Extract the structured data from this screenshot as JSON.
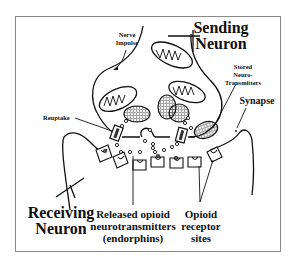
{
  "diagram": {
    "labels": {
      "sending_neuron_line1": "Sending",
      "sending_neuron_line2": "Neuron",
      "nerve_impulse_line1": "Nerve",
      "nerve_impulse_line2": "Impulse",
      "stored_line1": "Stored",
      "stored_line2": "Neuro-",
      "stored_line3": "Transmitters",
      "synapse": "Synapse",
      "reuptake": "Reuptake",
      "receiving_neuron_line1": "Receiving",
      "receiving_neuron_line2": "Neuron",
      "released_line1": "Released opioid",
      "released_line2": "neurotransmitters",
      "released_line3": "(endorphins)",
      "receptor_line1": "Opioid",
      "receptor_line2": "receptor",
      "receptor_line3": "sites"
    },
    "colors": {
      "ink": "#111111",
      "frame": "#8a8a8a",
      "background": "#ffffff"
    }
  }
}
